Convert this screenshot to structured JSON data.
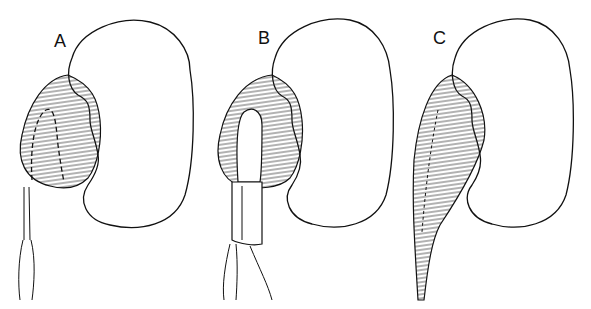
{
  "figure": {
    "panels": [
      {
        "label": "A",
        "stage": "incision outline marked (dashed) on dilated renal pelvis"
      },
      {
        "label": "B",
        "stage": "flap raised and sutured to spatulated ureter"
      },
      {
        "label": "C",
        "stage": "completed repair with suture line"
      }
    ]
  }
}
